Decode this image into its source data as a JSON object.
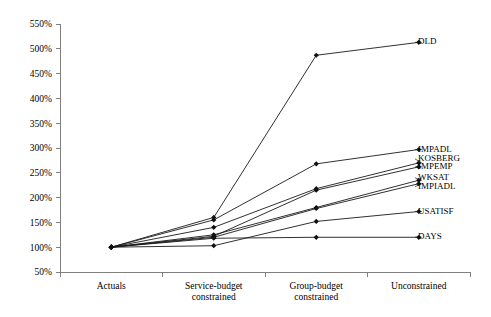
{
  "chart_data": {
    "type": "line",
    "title": "",
    "xlabel": "",
    "ylabel": "",
    "categories": [
      "Actuals",
      "Service-budget constrained",
      "Group-budget constrained",
      "Unconstrained"
    ],
    "ylim": [
      50,
      550
    ],
    "ytick_values": [
      50,
      100,
      150,
      200,
      250,
      300,
      350,
      400,
      450,
      500,
      550
    ],
    "ytick_labels": [
      "50%",
      "100%",
      "150%",
      "200%",
      "250%",
      "300%",
      "350%",
      "400%",
      "450%",
      "500%",
      "550%"
    ],
    "grid": false,
    "legend_position": "right-inline-labels",
    "marker": "filled-diamond",
    "line_color": "#1a1a1a",
    "series": [
      {
        "name": "DLD",
        "values": [
          100,
          160,
          487,
          513
        ]
      },
      {
        "name": "IMPADL",
        "values": [
          100,
          155,
          268,
          297
        ]
      },
      {
        "name": "KOSBERG",
        "values": [
          100,
          140,
          218,
          270
        ]
      },
      {
        "name": "IMPEMP",
        "values": [
          100,
          122,
          215,
          262
        ]
      },
      {
        "name": "WKSAT",
        "values": [
          100,
          125,
          180,
          235
        ]
      },
      {
        "name": "IMPIADL",
        "values": [
          100,
          120,
          178,
          228
        ]
      },
      {
        "name": "USATISF",
        "values": [
          100,
          103,
          152,
          172
        ]
      },
      {
        "name": "DAYS",
        "values": [
          100,
          118,
          120,
          120
        ]
      }
    ],
    "series_labels": [
      {
        "name": "DLD",
        "label_value": 513
      },
      {
        "name": "IMPADL",
        "label_value": 297
      },
      {
        "name": "KOSBERG",
        "label_value": 278
      },
      {
        "name": "IMPEMP",
        "label_value": 262
      },
      {
        "name": "WKSAT",
        "label_value": 240
      },
      {
        "name": "IMPIADL",
        "label_value": 222
      },
      {
        "name": "USATISF",
        "label_value": 172
      },
      {
        "name": "DAYS",
        "label_value": 120
      }
    ]
  }
}
